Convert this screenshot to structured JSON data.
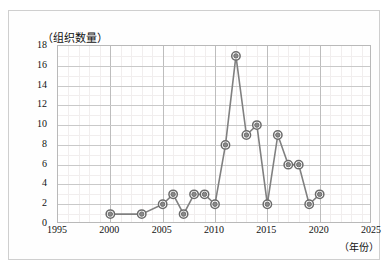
{
  "chart_data": {
    "type": "line",
    "title": "",
    "ylabel": "（组织数量）",
    "xlabel": "（年份）",
    "x": [
      2000,
      2003,
      2005,
      2006,
      2007,
      2008,
      2009,
      2010,
      2011,
      2012,
      2013,
      2014,
      2015,
      2016,
      2017,
      2018,
      2019,
      2020
    ],
    "values": [
      1,
      1,
      2,
      3,
      1,
      3,
      3,
      2,
      8,
      17,
      9,
      10,
      2,
      9,
      6,
      6,
      2,
      3
    ],
    "series": [
      {
        "name": "组织数量",
        "values": [
          1,
          1,
          2,
          3,
          1,
          3,
          3,
          2,
          8,
          17,
          9,
          10,
          2,
          9,
          6,
          6,
          2,
          3
        ]
      }
    ],
    "xlim": [
      1995,
      2025
    ],
    "ylim": [
      0,
      18
    ],
    "xticks": [
      "1995",
      "2000",
      "2005",
      "2010",
      "2015",
      "2020",
      "2025"
    ],
    "xtick_values": [
      1995,
      2000,
      2005,
      2010,
      2015,
      2020,
      2025
    ],
    "yticks": [
      "0",
      "2",
      "4",
      "6",
      "8",
      "10",
      "12",
      "14",
      "16",
      "18"
    ],
    "ytick_values": [
      0,
      2,
      4,
      6,
      8,
      10,
      12,
      14,
      16,
      18
    ],
    "grid": true,
    "minor_grid": true,
    "legend": "none",
    "marker": "circle-target",
    "line_color": "#808080",
    "marker_color": "#6b6b6b",
    "grid_color": "#c9c9c9",
    "minor_grid_color": "#f1eeee",
    "axis_color": "#b9b9b9",
    "background": "#ffffff"
  }
}
